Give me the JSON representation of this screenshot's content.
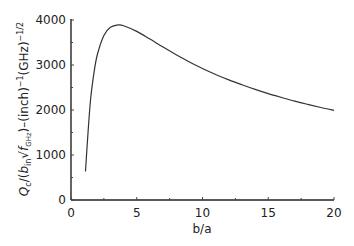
{
  "chart_data": {
    "type": "line",
    "title": "",
    "xlabel": "b/a",
    "ylabel": "Q_c/(b_in √f_GHz)–(inch)^-1(GHz)^-1/2",
    "ylabel_parts": {
      "q": "Q",
      "q_sub": "c",
      "open": "/(",
      "b": "b",
      "b_sub": "in",
      "sqrt": "√",
      "f": "f",
      "f_sub": "GHz",
      "close": ")–(inch)",
      "inch_exp": "−1",
      "ghz": "(GHz)",
      "ghz_exp": "−1/2"
    },
    "xlim": [
      0,
      20
    ],
    "ylim": [
      0,
      4000
    ],
    "x_ticks": [
      "0",
      "5",
      "10",
      "15",
      "20"
    ],
    "y_ticks": [
      "0",
      "1000",
      "2000",
      "3000",
      "4000"
    ],
    "grid": false,
    "legend": null,
    "series": [
      {
        "name": "Qc",
        "color": "#333333",
        "x": [
          1.1,
          1.3,
          1.5,
          1.75,
          2,
          2.5,
          3,
          3.59,
          4,
          5,
          6,
          7,
          8,
          9,
          10,
          11,
          12,
          13,
          14,
          15,
          16,
          17,
          18,
          19,
          20
        ],
        "y": [
          634,
          1520,
          2266,
          2830,
          3228,
          3657,
          3837,
          3890,
          3873,
          3747,
          3576,
          3398,
          3228,
          3068,
          2924,
          2790,
          2670,
          2561,
          2458,
          2364,
          2279,
          2198,
          2125,
          2056,
          1993
        ]
      }
    ]
  }
}
